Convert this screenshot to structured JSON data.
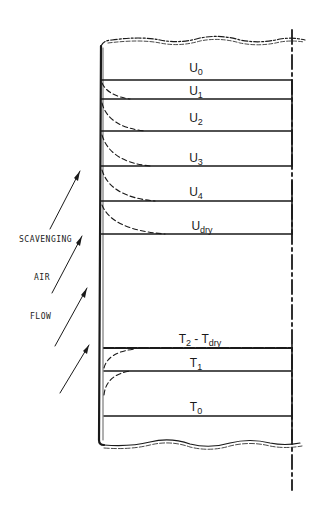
{
  "diagram": {
    "type": "stratified scavenging profile schematic",
    "colors": {
      "ink": "#1a1a1a",
      "background": "#ffffff"
    },
    "side_label": {
      "lines": [
        "SCAVENGING",
        "AIR",
        "FLOW"
      ]
    },
    "upper_layers": [
      {
        "id": "U0",
        "main": "U",
        "sub": "0",
        "line_y": 80
      },
      {
        "id": "U1",
        "main": "U",
        "sub": "1",
        "line_y": 99
      },
      {
        "id": "U2",
        "main": "U",
        "sub": "2",
        "line_y": 131
      },
      {
        "id": "U3",
        "main": "U",
        "sub": "3",
        "line_y": 166
      },
      {
        "id": "U4",
        "main": "U",
        "sub": "4",
        "line_y": 201
      },
      {
        "id": "Udry",
        "main": "U",
        "sub": "dry",
        "line_y": 234
      }
    ],
    "lower_layers": [
      {
        "id": "T2-Tdry",
        "main": "T",
        "sub": "2",
        "sep": " - ",
        "main2": "T",
        "sub2": "dry",
        "line_y": 348
      },
      {
        "id": "T1",
        "main": "T",
        "sub": "1",
        "line_y": 371
      },
      {
        "id": "T0",
        "main": "T",
        "sub": "0",
        "line_y": 416
      }
    ]
  }
}
